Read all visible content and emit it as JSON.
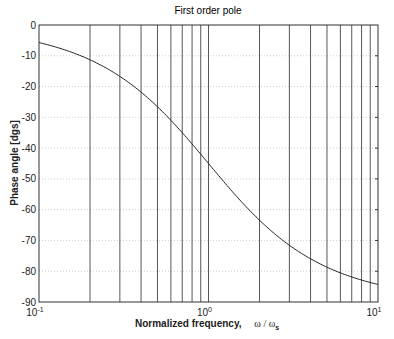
{
  "chart_data": {
    "type": "line",
    "title": "First order pole",
    "xlabel": "Normalized frequency,",
    "xlabel_math": "ω / ω",
    "xlabel_sub": "s",
    "ylabel": "Phase angle [dgs]",
    "xscale": "log",
    "xlim": [
      0.1,
      10
    ],
    "ylim": [
      -90,
      0
    ],
    "xticks": [
      {
        "value": 0.1,
        "base": "10",
        "exp": "-1"
      },
      {
        "value": 1,
        "base": "10",
        "exp": "0"
      },
      {
        "value": 10,
        "base": "10",
        "exp": "1"
      }
    ],
    "yticks": [
      0,
      -10,
      -20,
      -30,
      -40,
      -50,
      -60,
      -70,
      -80,
      -90
    ],
    "grid": true,
    "series": [
      {
        "name": "phase",
        "function": "-atan(w/ws) in degrees",
        "x": [
          0.1,
          0.15,
          0.2,
          0.3,
          0.4,
          0.5,
          0.6,
          0.7,
          0.8,
          0.9,
          1.0,
          1.5,
          2,
          3,
          4,
          5,
          6,
          7,
          8,
          9,
          10
        ],
        "values": [
          -5.7,
          -8.5,
          -11.3,
          -16.7,
          -21.8,
          -26.6,
          -31.0,
          -35.0,
          -38.7,
          -42.0,
          -45.0,
          -56.3,
          -63.4,
          -71.6,
          -76.0,
          -78.7,
          -80.5,
          -81.9,
          -82.9,
          -83.7,
          -84.3
        ]
      }
    ]
  }
}
